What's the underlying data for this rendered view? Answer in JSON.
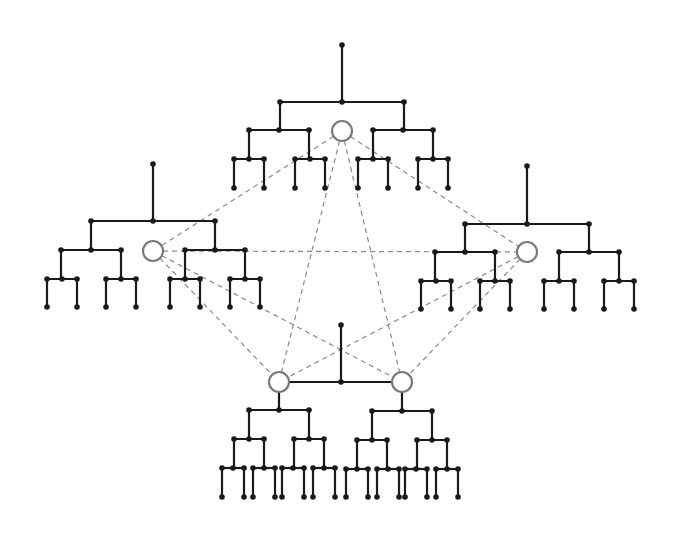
{
  "diagram": {
    "title": "",
    "colors": {
      "background": "#ffffff",
      "tree_line": "#1a1a1a",
      "hub_stroke": "#7a7a7a",
      "dashed_line": "#8a8a8a"
    },
    "hubs": [
      {
        "id": "top",
        "x": 342,
        "y": 131,
        "r": 10
      },
      {
        "id": "left",
        "x": 153,
        "y": 251,
        "r": 10
      },
      {
        "id": "right",
        "x": 527,
        "y": 252,
        "r": 10
      },
      {
        "id": "bottom-left",
        "x": 279,
        "y": 382,
        "r": 10
      },
      {
        "id": "bottom-right",
        "x": 402,
        "y": 382,
        "r": 10
      }
    ],
    "hub_edges": [
      {
        "from": "top",
        "to": "left",
        "style": "dashed"
      },
      {
        "from": "top",
        "to": "right",
        "style": "dashed"
      },
      {
        "from": "top",
        "to": "bottom-left",
        "style": "dashed"
      },
      {
        "from": "top",
        "to": "bottom-right",
        "style": "dashed"
      },
      {
        "from": "left",
        "to": "right",
        "style": "dashed"
      },
      {
        "from": "left",
        "to": "bottom-left",
        "style": "dashed"
      },
      {
        "from": "left",
        "to": "bottom-right",
        "style": "dashed"
      },
      {
        "from": "right",
        "to": "bottom-left",
        "style": "dashed"
      },
      {
        "from": "right",
        "to": "bottom-right",
        "style": "dashed"
      },
      {
        "from": "bottom-left",
        "to": "bottom-right",
        "style": "solid"
      }
    ],
    "trees": [
      {
        "id": "top-tree",
        "root": {
          "x": 342,
          "y": 45
        },
        "trunk_y": 102,
        "levels": [
          {
            "y": 102,
            "centers": [
              342
            ],
            "half": 62
          },
          {
            "y": 130,
            "centers": [
              279,
              403
            ],
            "half": 30
          },
          {
            "y": 159,
            "centers": [
              249,
              310,
              373,
              433
            ],
            "half": 15
          }
        ],
        "leaf_y": 188
      },
      {
        "id": "left-tree",
        "root": {
          "x": 153,
          "y": 164
        },
        "trunk_y": 221,
        "levels": [
          {
            "y": 221,
            "centers": [
              153
            ],
            "half": 62
          },
          {
            "y": 250,
            "centers": [
              91,
              215
            ],
            "half": 30
          },
          {
            "y": 279,
            "centers": [
              62,
              121,
              185,
              245
            ],
            "half": 15
          }
        ],
        "leaf_y": 307
      },
      {
        "id": "right-tree",
        "root": {
          "x": 527,
          "y": 166
        },
        "trunk_y": 224,
        "levels": [
          {
            "y": 224,
            "centers": [
              527
            ],
            "half": 62
          },
          {
            "y": 252,
            "centers": [
              465,
              589
            ],
            "half": 30
          },
          {
            "y": 281,
            "centers": [
              436,
              495,
              559,
              619
            ],
            "half": 15
          }
        ],
        "leaf_y": 309
      },
      {
        "id": "bottom-left-tree",
        "root": {
          "x": 279,
          "y": 392
        },
        "trunk_y": 410,
        "levels": [
          {
            "y": 410,
            "centers": [
              279
            ],
            "half": 30
          },
          {
            "y": 439,
            "centers": [
              249,
              309
            ],
            "half": 15
          },
          {
            "y": 468,
            "centers": [
              233,
              264,
              293,
              324
            ],
            "half": 11
          }
        ],
        "leaf_y": 497
      },
      {
        "id": "bottom-right-tree",
        "root": {
          "x": 402,
          "y": 392
        },
        "trunk_y": 411,
        "levels": [
          {
            "y": 411,
            "centers": [
              402
            ],
            "half": 30
          },
          {
            "y": 440,
            "centers": [
              372,
              432
            ],
            "half": 15
          },
          {
            "y": 469,
            "centers": [
              357,
              388,
              416,
              447
            ],
            "half": 11
          }
        ],
        "leaf_y": 497
      }
    ],
    "bottom_connector": {
      "root": {
        "x": 341,
        "y": 325
      },
      "junction": {
        "x": 341,
        "y": 382
      }
    }
  }
}
